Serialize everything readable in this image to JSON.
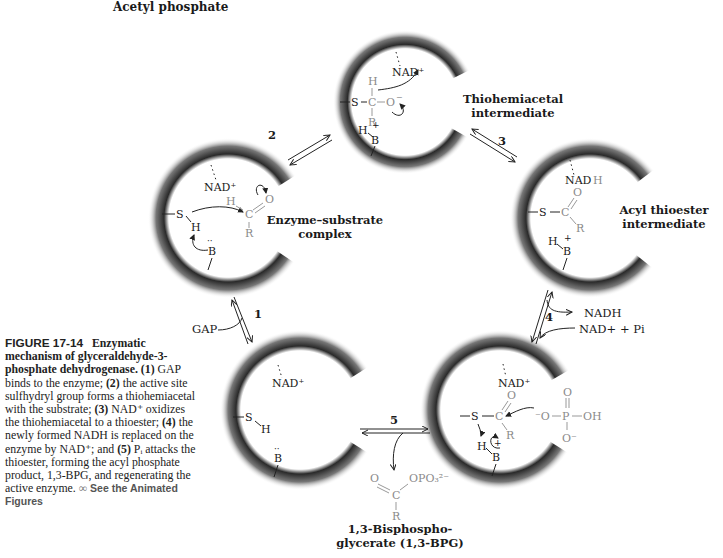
{
  "header": {
    "title": "Acetyl phosphate"
  },
  "states": [
    {
      "id": "enzyme-substrate",
      "label_line1": "Enzyme–substrate",
      "label_line2": "complex",
      "cofactor": "NAD+"
    },
    {
      "id": "thiohemiacetal",
      "label_line1": "Thiohemiacetal",
      "label_line2": "intermediate",
      "cofactor": "NAD+"
    },
    {
      "id": "acyl-thioester",
      "label_line1": "Acyl thioester",
      "label_line2": "intermediate",
      "cofactor": "NADH"
    },
    {
      "id": "acyl-phosphate-attack",
      "cofactor": "NAD+"
    },
    {
      "id": "free-enzyme",
      "cofactor": "NAD+"
    }
  ],
  "steps": [
    {
      "number": "1",
      "input": "GAP"
    },
    {
      "number": "2"
    },
    {
      "number": "3"
    },
    {
      "number": "4",
      "output": "NADH",
      "input": "NAD+ + Pi"
    },
    {
      "number": "5"
    }
  ],
  "product": {
    "label_line1": "1,3-Bisphospho-",
    "label_line2": "glycerate (1,3-BPG)",
    "group": "OPO3 2−"
  },
  "atoms": {
    "S": "S",
    "H": "H",
    "C": "C",
    "O": "O",
    "R": "R",
    "B": "B",
    "P": "P",
    "OH": "OH",
    "Ominus": "O−"
  },
  "caption": {
    "head": "FIGURE 17-14",
    "title": "Enzymatic mechanism of glyceraldehyde-3-phosphate dehydrogenase.",
    "s1_num": "(1)",
    "s1": " GAP binds to the enzyme;",
    "s2_num": "(2)",
    "s2": " the active site sulfhydryl group forms a thiohemiacetal with the substrate;",
    "s3_num": "(3)",
    "s3": " NAD⁺ oxidizes the thiohemiacetal to a thioester;",
    "s4_num": "(4)",
    "s4": " the newly formed NADH is replaced on the enzyme by NAD⁺; and",
    "s5_num": "(5)",
    "s5": " Pᵢ attacks the thioester, forming the acyl phosphate product, 1,3-BPG, and regenerating the active enzyme.",
    "link": "See the Animated Figures"
  }
}
